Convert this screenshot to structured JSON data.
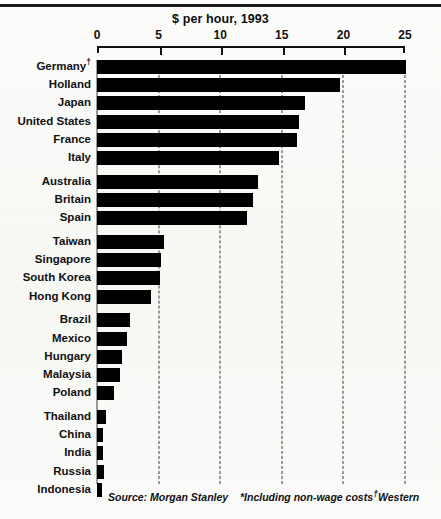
{
  "chart_data": {
    "type": "bar",
    "orientation": "horizontal",
    "title": "$ per hour, 1993",
    "xlabel": "",
    "ylabel": "",
    "xlim": [
      0,
      25
    ],
    "xticks": [
      0,
      5,
      10,
      15,
      20,
      25
    ],
    "xtick_labels": [
      "0",
      "5",
      "10",
      "15",
      "20",
      "25"
    ],
    "grid": "vertical-dashed",
    "legend": "none",
    "bar_color": "#000000",
    "categories": [
      "Germany†",
      "Holland",
      "Japan",
      "United States",
      "France",
      "Italy",
      "Australia",
      "Britain",
      "Spain",
      "Taiwan",
      "Singapore",
      "South Korea",
      "Hong Kong",
      "Brazil",
      "Mexico",
      "Hungary",
      "Malaysia",
      "Poland",
      "Thailand",
      "China",
      "India",
      "Russia",
      "Indonesia"
    ],
    "values": [
      25.1,
      19.7,
      16.9,
      16.4,
      16.2,
      14.8,
      13.1,
      12.7,
      12.2,
      5.4,
      5.2,
      5.1,
      4.4,
      2.7,
      2.4,
      2.0,
      1.9,
      1.4,
      0.75,
      0.5,
      0.5,
      0.55,
      0.4
    ],
    "groups": [
      {
        "name": "high-wage",
        "start": 0,
        "count": 6
      },
      {
        "name": "upper-middle",
        "start": 6,
        "count": 3
      },
      {
        "name": "asian-tigers",
        "start": 9,
        "count": 4
      },
      {
        "name": "emerging",
        "start": 13,
        "count": 5
      },
      {
        "name": "low-wage",
        "start": 18,
        "count": 5
      }
    ],
    "annotations": [
      "Source: Morgan Stanley",
      "*Including non-wage costs",
      "†Western"
    ]
  },
  "footnotes": {
    "source": "Source:  Morgan Stanley",
    "star_note": "*Including non-wage costs",
    "dagger_note": "Western",
    "dagger_symbol": "†"
  }
}
